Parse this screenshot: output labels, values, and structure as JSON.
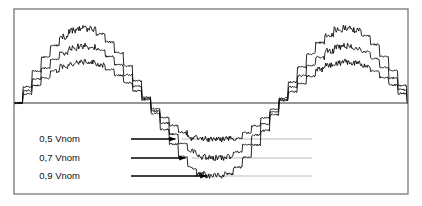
{
  "figure": {
    "canvas": {
      "width": 422,
      "height": 206,
      "background": "#ffffff"
    },
    "frame": {
      "x": 14,
      "y": 9,
      "width": 394,
      "height": 185,
      "color": "#808080",
      "stroke_width": 1.4
    },
    "axis": {
      "label": "zero-volt axis",
      "y": 103,
      "x_start": 14,
      "x_end": 408,
      "color": "#333333",
      "stroke_width": 1.2
    }
  },
  "annotations": [
    {
      "name": "annotation-0-5-vnom",
      "label": "0,5 Vnom",
      "label_x": 80,
      "label_y": 139,
      "arrow_start_x": 131,
      "arrow_end_x": 182,
      "arrow_y": 139,
      "ref_line_start_x": 182,
      "ref_line_end_x": 312,
      "ref_line_y": 139,
      "arrow_color": "#000000",
      "ref_line_color": "#b4b4b4"
    },
    {
      "name": "annotation-0-7-vnom",
      "label": "0,7 Vnom",
      "label_x": 80,
      "label_y": 158,
      "arrow_start_x": 131,
      "arrow_end_x": 192,
      "arrow_y": 158,
      "ref_line_start_x": 192,
      "ref_line_end_x": 312,
      "ref_line_y": 158,
      "arrow_color": "#000000",
      "ref_line_color": "#b4b4b4"
    },
    {
      "name": "annotation-0-9-vnom",
      "label": "0,9 Vnom",
      "label_x": 80,
      "label_y": 176,
      "arrow_start_x": 131,
      "arrow_end_x": 213,
      "arrow_y": 176,
      "ref_line_start_x": 213,
      "ref_line_end_x": 312,
      "ref_line_y": 176,
      "arrow_color": "#000000",
      "ref_line_color": "#b4b4b4"
    }
  ],
  "chart_data": {
    "type": "line",
    "xlabel": "",
    "ylabel": "",
    "grid": false,
    "legend": "inline-arrow-annotations",
    "x_range_px": [
      14,
      408
    ],
    "baseline_y_px": 103,
    "cycles": 1.5,
    "phase_start": 0,
    "waveform_description": "Three superimposed sinusoids of 1.5 periods, each amplitude-clipped (flat-topped) at a different fraction of nominal voltage, with quantization steps and high-frequency noise riding on the trace.",
    "series": [
      {
        "name": "0,5 Vnom",
        "amplitude_fraction": 0.5,
        "clip_level_positive_px": 62,
        "clip_level_negative_px": 139,
        "peak_amplitude_px": 41,
        "color": "#000000",
        "noise_amplitude_px": 3.0,
        "step_count": 44
      },
      {
        "name": "0,7 Vnom",
        "amplitude_fraction": 0.7,
        "clip_level_positive_px": 44,
        "clip_level_negative_px": 158,
        "peak_amplitude_px": 57,
        "color": "#000000",
        "noise_amplitude_px": 3.0,
        "step_count": 44
      },
      {
        "name": "0,9 Vnom",
        "amplitude_fraction": 0.9,
        "clip_level_positive_px": 26,
        "clip_level_negative_px": 176,
        "peak_amplitude_px": 75,
        "color": "#000000",
        "noise_amplitude_px": 3.0,
        "step_count": 44
      }
    ],
    "annotation_values": [
      "0,5 Vnom",
      "0,7 Vnom",
      "0,9 Vnom"
    ]
  }
}
